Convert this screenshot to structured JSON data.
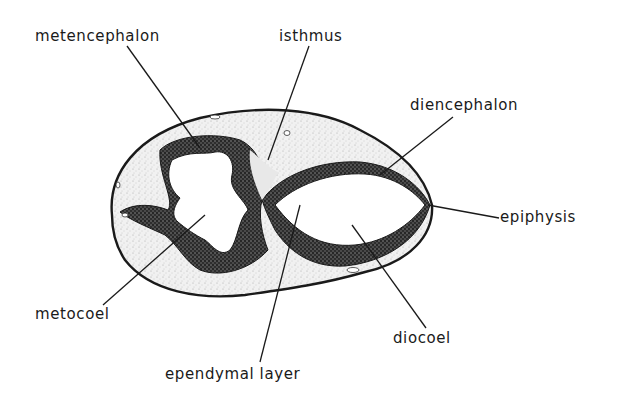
{
  "figure": {
    "type": "anatomical-section-diagram",
    "background": "#ffffff",
    "ink_color": "#1a1a1a",
    "labels": [
      {
        "id": "metencephalon",
        "text": "metencephalon",
        "x": 35,
        "y": 41,
        "line": [
          127,
          46,
          200,
          148
        ]
      },
      {
        "id": "isthmus",
        "text": "isthmus",
        "x": 279,
        "y": 41,
        "line": [
          309,
          46,
          268,
          160
        ]
      },
      {
        "id": "diencephalon",
        "text": "diencephalon",
        "x": 410,
        "y": 110,
        "line": [
          453,
          117,
          380,
          175
        ]
      },
      {
        "id": "epiphysis",
        "text": "epiphysis",
        "x": 500,
        "y": 222,
        "line": [
          499,
          218,
          428,
          205
        ]
      },
      {
        "id": "metocoel",
        "text": "metocoel",
        "x": 35,
        "y": 319,
        "line": [
          103,
          305,
          205,
          215
        ]
      },
      {
        "id": "ependymal-layer",
        "text": "ependymal layer",
        "x": 165,
        "y": 379,
        "line": [
          260,
          362,
          300,
          205
        ]
      },
      {
        "id": "diocoel",
        "text": "diocoel",
        "x": 393,
        "y": 343,
        "line": [
          426,
          328,
          352,
          225
        ]
      }
    ]
  }
}
